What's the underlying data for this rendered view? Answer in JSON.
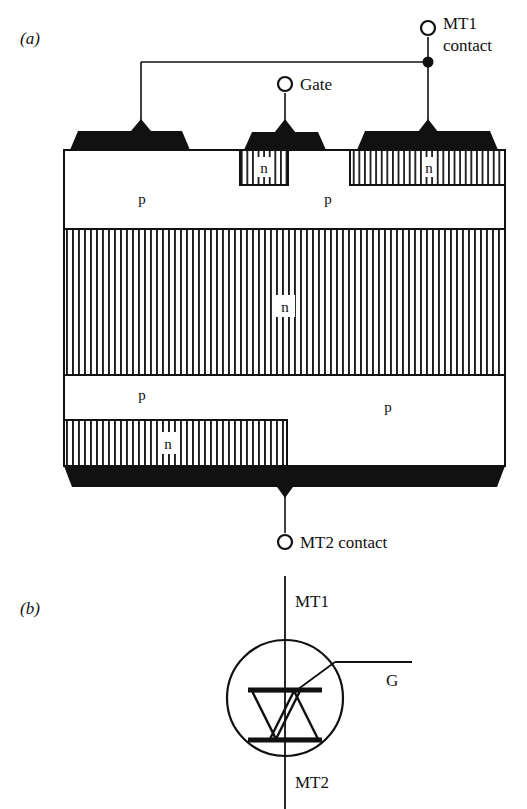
{
  "figure": {
    "ink_color": "#111111",
    "background_color": "#ffffff",
    "panels": [
      {
        "id": "a",
        "label": "(a)",
        "caption": "Cross-section of TRIAC structure"
      },
      {
        "id": "b",
        "label": "(b)",
        "caption": "TRIAC circuit symbol"
      }
    ]
  },
  "cross_section": {
    "panel_label": "(a)",
    "terminals": [
      {
        "name": "mt1",
        "label_line1": "MT1",
        "label_line2": "contact"
      },
      {
        "name": "gate",
        "label_line1": "Gate",
        "label_line2": ""
      },
      {
        "name": "mt2",
        "label_line1": "MT2",
        "label_line2": "contact"
      }
    ],
    "mt1_label_line1": "MT1",
    "mt1_label_line2": "contact",
    "gate_label": "Gate",
    "mt2_label": "MT2  contact",
    "regions": [
      {
        "name": "gate-n-emitter",
        "type": "n",
        "label": "n",
        "hatched": true
      },
      {
        "name": "mt1-n-emitter",
        "type": "n",
        "label": "n",
        "hatched": true
      },
      {
        "name": "upper-p-base-left",
        "type": "p",
        "label": "p",
        "hatched": false
      },
      {
        "name": "upper-p-base-right",
        "type": "p",
        "label": "p",
        "hatched": false
      },
      {
        "name": "n-drift-base",
        "type": "n",
        "label": "n",
        "hatched": true
      },
      {
        "name": "lower-p-base-left",
        "type": "p",
        "label": "p",
        "hatched": false
      },
      {
        "name": "lower-p-base-right",
        "type": "p",
        "label": "p",
        "hatched": false
      },
      {
        "name": "mt2-n-emitter",
        "type": "n",
        "label": "n",
        "hatched": true
      }
    ],
    "region_labels": {
      "upper_p_left": "p",
      "upper_p_right": "p",
      "gate_n": "n",
      "mt1_n": "n",
      "n_drift": "n",
      "lower_p_left": "p",
      "lower_p_right": "p",
      "mt2_n": "n"
    }
  },
  "symbol": {
    "panel_label": "(b)",
    "top_terminal_label": "MT1",
    "bottom_terminal_label": "MT2",
    "gate_terminal_label": "G"
  }
}
